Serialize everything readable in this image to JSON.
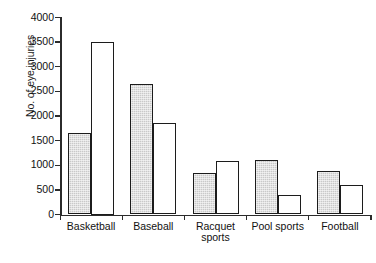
{
  "chart_data": {
    "type": "bar",
    "title": "",
    "xlabel": "",
    "ylabel": "No. of eye injuries",
    "ylim": [
      0,
      4000
    ],
    "yticks": [
      0,
      500,
      1000,
      1500,
      2000,
      2500,
      3000,
      3500,
      4000
    ],
    "ytick_labels": [
      "0",
      "500",
      "1000",
      "1500",
      "2000",
      "2500",
      "3000",
      "3500",
      "4000"
    ],
    "grid": false,
    "legend": "none",
    "categories": [
      "Basketball",
      "Baseball",
      "Racquet\nsports",
      "Pool sports",
      "Football"
    ],
    "series": [
      {
        "name": "series-shaded",
        "style": "shaded",
        "color": "#c9c9c9",
        "values": [
          1650,
          2650,
          850,
          1100,
          880
        ]
      },
      {
        "name": "series-open",
        "style": "open",
        "color": "#ffffff",
        "values": [
          3500,
          1850,
          1080,
          400,
          590
        ]
      }
    ]
  },
  "axes": {
    "y_title": "No. of eye injuries"
  }
}
